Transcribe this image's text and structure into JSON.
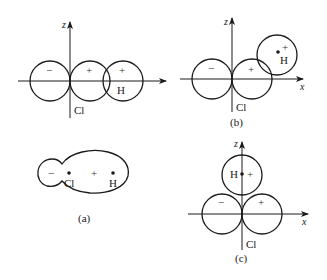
{
  "figure": {
    "axis_labels": {
      "x": "x",
      "z": "z"
    },
    "panels": {
      "top_left": {
        "caption": "",
        "lobe_signs": [
          "−",
          "+",
          "+"
        ],
        "atoms": {
          "cl": "Cl",
          "h": "H"
        }
      },
      "b": {
        "caption": "(b)",
        "lobe_signs": [
          "−",
          "+",
          "+"
        ],
        "atoms": {
          "cl": "Cl",
          "h": "H"
        }
      },
      "a": {
        "caption": "(a)",
        "lobe_signs": [
          "−",
          "+"
        ],
        "atoms": {
          "cl": "Cl",
          "h": "H"
        }
      },
      "c": {
        "caption": "(c)",
        "lobe_signs": [
          "−",
          "+",
          "+"
        ],
        "atoms": {
          "cl": "Cl",
          "h": "H"
        }
      }
    }
  }
}
